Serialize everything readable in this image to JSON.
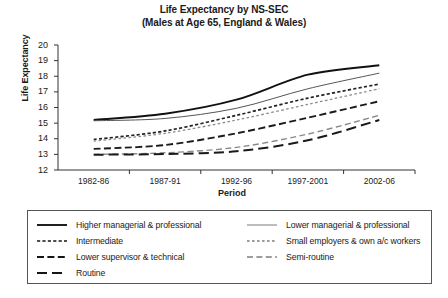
{
  "chart_data": {
    "type": "line",
    "title": "Life Expectancy by NS-SEC",
    "subtitle": "(Males at Age 65, England & Wales)",
    "xlabel": "Period",
    "ylabel": "Life Expectancy",
    "ylim": [
      12,
      20
    ],
    "ytick_step": 1,
    "grid": false,
    "legend_position": "bottom",
    "categories": [
      "1982-86",
      "1987-91",
      "1992-96",
      "1997-2001",
      "2002-06"
    ],
    "yticks": [
      "20",
      "19",
      "18",
      "17",
      "16",
      "15",
      "14",
      "13",
      "12"
    ],
    "series": [
      {
        "name": "Higher managerial & professional",
        "style": "solid-bold",
        "color": "#111111",
        "values": [
          15.2,
          15.6,
          16.5,
          18.1,
          18.7
        ]
      },
      {
        "name": "Lower managerial & professional",
        "style": "solid-thin",
        "color": "#555555",
        "values": [
          15.15,
          15.3,
          15.95,
          17.2,
          18.2
        ]
      },
      {
        "name": "Intermediate",
        "style": "dotted-bold",
        "color": "#222222",
        "values": [
          13.95,
          14.5,
          15.5,
          16.6,
          17.5
        ]
      },
      {
        "name": "Small employers & own a/c workers",
        "style": "dotted-thin",
        "color": "#8a8a8a",
        "values": [
          13.85,
          14.35,
          15.2,
          16.2,
          17.2
        ]
      },
      {
        "name": "Lower supervisor & technical",
        "style": "dashed-bold",
        "color": "#1a1a1a",
        "values": [
          13.35,
          13.6,
          14.35,
          15.35,
          16.4
        ]
      },
      {
        "name": "Semi-routine",
        "style": "dashed-thin",
        "color": "#8a8a8a",
        "values": [
          13.0,
          13.1,
          13.45,
          14.3,
          15.5
        ]
      },
      {
        "name": "Routine",
        "style": "longdash-bold",
        "color": "#1a1a1a",
        "values": [
          12.98,
          13.02,
          13.2,
          13.9,
          15.2
        ]
      }
    ]
  },
  "legend": {
    "left_column": [
      {
        "label": "Higher managerial & professional",
        "style": "solid-bold"
      },
      {
        "label": "Intermediate",
        "style": "dotted-bold"
      },
      {
        "label": "Lower supervisor & technical",
        "style": "dashed-bold"
      },
      {
        "label": "Routine",
        "style": "longdash-bold"
      }
    ],
    "right_column": [
      {
        "label": "Lower managerial & professional",
        "style": "solid-thin"
      },
      {
        "label": "Small employers & own a/c workers",
        "style": "dotted-thin"
      },
      {
        "label": "Semi-routine",
        "style": "dashed-thin"
      }
    ]
  }
}
